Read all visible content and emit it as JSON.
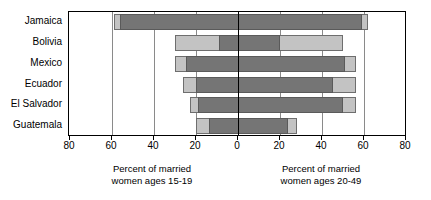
{
  "chart_data": {
    "type": "bar",
    "subtype": "diverging-paired-horizontal",
    "title": "Latin America and the Caribbean",
    "title_clipped": true,
    "categories": [
      "Jamaica",
      "Bolivia",
      "Mexico",
      "Ecuador",
      "El Salvador",
      "Guatemala"
    ],
    "xlabel_left": "Percent of married women ages 15-19",
    "xlabel_right": "Percent of married women ages 20-49",
    "ylabel": "",
    "xlim_left": [
      0,
      80
    ],
    "xlim_right": [
      0,
      80
    ],
    "tick_labels": [
      "80",
      "60",
      "40",
      "20",
      "0",
      "20",
      "40",
      "60",
      "80"
    ],
    "tick_values": [
      -80,
      -60,
      -40,
      -20,
      0,
      20,
      40,
      60,
      80
    ],
    "grid": true,
    "legend": "none",
    "series": [
      {
        "name": "Outer (light) range",
        "color": "#c3c3c3",
        "left_values": [
          59,
          30,
          30,
          26,
          23,
          20
        ],
        "right_values": [
          62,
          50,
          56,
          56,
          56,
          28
        ]
      },
      {
        "name": "Inner (dark) range",
        "color": "#757575",
        "left_values": [
          56,
          9,
          25,
          20,
          19,
          14
        ],
        "right_values": [
          59,
          20,
          51,
          45,
          50,
          24
        ]
      }
    ]
  },
  "axis": {
    "ticks": [
      {
        "label": "80",
        "value": -80
      },
      {
        "label": "60",
        "value": -60
      },
      {
        "label": "40",
        "value": -40
      },
      {
        "label": "20",
        "value": -20
      },
      {
        "label": "0",
        "value": 0
      },
      {
        "label": "20",
        "value": 20
      },
      {
        "label": "40",
        "value": 40
      },
      {
        "label": "60",
        "value": 60
      },
      {
        "label": "80",
        "value": 80
      }
    ]
  },
  "captions": {
    "left_line1": "Percent of married",
    "left_line2": "women ages 15-19",
    "right_line1": "Percent of married",
    "right_line2": "women ages 20-49"
  },
  "colors": {
    "light_bar": "#c3c3c3",
    "dark_bar": "#757575",
    "axis": "#000000",
    "grid": "#8a8a8a",
    "background": "#ffffff"
  }
}
